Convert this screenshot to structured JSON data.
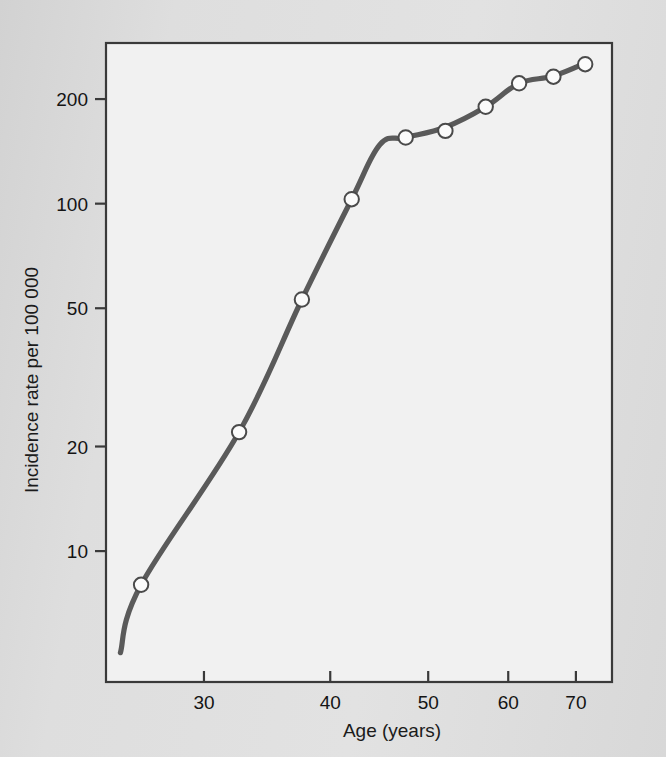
{
  "chart_data": {
    "type": "line",
    "title": "",
    "xlabel": "Age (years)",
    "ylabel": "Incidence rate per 100 000",
    "xscale": "log",
    "yscale": "log",
    "grid": false,
    "legend": "none",
    "xlim": [
      24.0,
      76.0
    ],
    "ylim": [
      4.2,
      290
    ],
    "xticks": [
      30,
      40,
      50,
      60,
      70
    ],
    "xtick_labels": [
      "30",
      "40",
      "50",
      "60",
      "70"
    ],
    "yticks": [
      10,
      20,
      50,
      100,
      200
    ],
    "ytick_labels": [
      "10",
      "20",
      "50",
      "100",
      "200"
    ],
    "marker": "open-circle",
    "series": [
      {
        "name": "Incidence rate",
        "x": [
          26.0,
          32.5,
          37.5,
          42.0,
          47.5,
          52.0,
          57.0,
          61.5,
          66.5,
          71.5
        ],
        "y": [
          8.0,
          22.0,
          53.0,
          103.0,
          155.0,
          162.0,
          190.0,
          222.0,
          232.0,
          252.0
        ]
      }
    ],
    "line_vertices": [
      {
        "x": 24.8,
        "y": 5.1
      },
      {
        "x": 26.0,
        "y": 8.0
      },
      {
        "x": 32.5,
        "y": 22.0
      },
      {
        "x": 37.5,
        "y": 53.0
      },
      {
        "x": 42.0,
        "y": 103.0
      },
      {
        "x": 44.8,
        "y": 148.0
      },
      {
        "x": 47.5,
        "y": 155.0
      },
      {
        "x": 52.0,
        "y": 166.0
      },
      {
        "x": 57.0,
        "y": 190.0
      },
      {
        "x": 61.5,
        "y": 222.0
      },
      {
        "x": 66.5,
        "y": 233.0
      },
      {
        "x": 71.8,
        "y": 255.0
      }
    ]
  },
  "style": {
    "page_background": "#dcdcdc",
    "plot_background": "#f1f1f1",
    "frame_color": "#3a3a3a",
    "line_color": "#5a5a5a",
    "marker_fill": "#fbfbfb",
    "marker_stroke": "#4a4a4a",
    "text_color": "#141414"
  }
}
